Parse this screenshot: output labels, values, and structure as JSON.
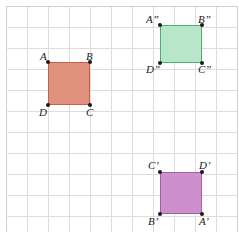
{
  "figure": {
    "grid": {
      "cell_size_px": 21,
      "cols": 11,
      "rows": 11,
      "line_color": "#dcdcdc",
      "border_color": "#cfcfcf",
      "background": "#ffffff"
    },
    "shapes": [
      {
        "id": "square-abcd",
        "name": "original-square",
        "fill": "#e0917c",
        "stroke": "#c4614a",
        "x": 48,
        "y": 62,
        "w": 42,
        "h": 43,
        "vertices": [
          {
            "key": "A",
            "label": "A",
            "corner": "top-left"
          },
          {
            "key": "B",
            "label": "B",
            "corner": "top-right"
          },
          {
            "key": "C",
            "label": "C",
            "corner": "bottom-right"
          },
          {
            "key": "D",
            "label": "D",
            "corner": "bottom-left"
          }
        ]
      },
      {
        "id": "square-a2b2c2d2",
        "name": "double-prime-square",
        "fill": "#b8e6c8",
        "stroke": "#4fae74",
        "x": 160,
        "y": 25,
        "w": 42,
        "h": 38,
        "vertices": [
          {
            "key": "A2",
            "label": "A”",
            "corner": "top-left"
          },
          {
            "key": "B2",
            "label": "B”",
            "corner": "top-right"
          },
          {
            "key": "C2",
            "label": "C”",
            "corner": "bottom-right"
          },
          {
            "key": "D2",
            "label": "D”",
            "corner": "bottom-left"
          }
        ]
      },
      {
        "id": "square-a1b1c1d1",
        "name": "single-prime-square",
        "fill": "#cd8fcd",
        "stroke": "#a45fa4",
        "x": 160,
        "y": 172,
        "w": 42,
        "h": 42,
        "vertices": [
          {
            "key": "C1",
            "label": "C’",
            "corner": "top-left"
          },
          {
            "key": "D1",
            "label": "D’",
            "corner": "top-right"
          },
          {
            "key": "A1",
            "label": "A’",
            "corner": "bottom-right"
          },
          {
            "key": "B1",
            "label": "B’",
            "corner": "bottom-left"
          }
        ]
      }
    ],
    "labels": [
      {
        "name": "label-A",
        "text": "A",
        "x": 40,
        "y": 51
      },
      {
        "name": "label-B",
        "text": "B",
        "x": 86,
        "y": 51
      },
      {
        "name": "label-D",
        "text": "D",
        "x": 39,
        "y": 107
      },
      {
        "name": "label-C",
        "text": "C",
        "x": 86,
        "y": 107
      },
      {
        "name": "label-A2",
        "text": "A”",
        "x": 146,
        "y": 14
      },
      {
        "name": "label-B2",
        "text": "B”",
        "x": 198,
        "y": 14
      },
      {
        "name": "label-D2",
        "text": "D”",
        "x": 146,
        "y": 64
      },
      {
        "name": "label-C2",
        "text": "C”",
        "x": 198,
        "y": 64
      },
      {
        "name": "label-C1",
        "text": "C’",
        "x": 148,
        "y": 160
      },
      {
        "name": "label-D1",
        "text": "D’",
        "x": 199,
        "y": 160
      },
      {
        "name": "label-B1",
        "text": "B’",
        "x": 148,
        "y": 216
      },
      {
        "name": "label-A1",
        "text": "A’",
        "x": 199,
        "y": 216
      }
    ]
  }
}
